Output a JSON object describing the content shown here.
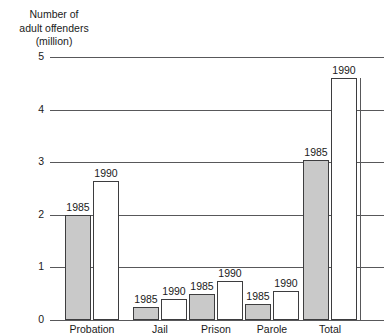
{
  "axis_title": {
    "line1": "Number of",
    "line2": "adult offenders",
    "line3": "(million)"
  },
  "chart_data": {
    "type": "bar",
    "title": "",
    "subtitle": "",
    "xlabel": "",
    "ylabel": "Number of adult offenders (million)",
    "ylim": [
      0,
      5
    ],
    "yticks": [
      0,
      1,
      2,
      3,
      4,
      5
    ],
    "ytick_labels": [
      "0",
      "1",
      "2",
      "3",
      "4",
      "5"
    ],
    "grid": true,
    "legend": "none",
    "categories": [
      "Probation",
      "Jail",
      "Prison",
      "Parole",
      "Total"
    ],
    "series": [
      {
        "name": "1985",
        "style": "shaded",
        "values": [
          2.0,
          0.25,
          0.5,
          0.3,
          3.05
        ]
      },
      {
        "name": "1990",
        "style": "open",
        "values": [
          2.65,
          0.4,
          0.75,
          0.55,
          4.6
        ]
      }
    ],
    "bar_labels": [
      [
        "1985",
        "1990"
      ],
      [
        "1985",
        "1990"
      ],
      [
        "1985",
        "1990"
      ],
      [
        "1985",
        "1990"
      ],
      [
        "1985",
        "1990"
      ]
    ],
    "colors": {
      "shaded_fill": "#c9c9c9",
      "open_fill": "#ffffff",
      "bar_stroke": "#3d3d3f",
      "gridline": "#58585a",
      "text": "#1a1a1a"
    }
  }
}
